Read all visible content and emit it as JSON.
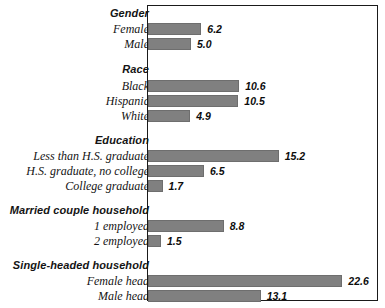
{
  "chart": {
    "type": "bar",
    "orientation": "horizontal",
    "title": "",
    "xlabel": "",
    "ylabel": "",
    "grid": false,
    "legend": null,
    "axis_labels_visible": false,
    "frame": true,
    "bar_color": "#808080",
    "frame_color": "#1a1a1a",
    "value_label_suffix": ""
  },
  "chart_data": {
    "type": "bar",
    "orientation": "horizontal",
    "title": "",
    "xlabel": "",
    "ylabel": "",
    "xlim": [
      0,
      26
    ],
    "grid": false,
    "legend": null,
    "groups": [
      {
        "name": "Gender",
        "categories": [
          "Female",
          "Male"
        ],
        "values": [
          6.2,
          5.0
        ]
      },
      {
        "name": "Race",
        "categories": [
          "Black",
          "Hispanic",
          "White"
        ],
        "values": [
          10.6,
          10.5,
          4.9
        ]
      },
      {
        "name": "Education",
        "categories": [
          "Less than H.S. graduate",
          "H.S. graduate, no college",
          "College graduate"
        ],
        "values": [
          15.2,
          6.5,
          1.7
        ]
      },
      {
        "name": "Married couple household",
        "categories": [
          "1 employed",
          "2 employed"
        ],
        "values": [
          8.8,
          1.5
        ]
      },
      {
        "name": "Single-headed household",
        "categories": [
          "Female head",
          "Male head"
        ],
        "values": [
          22.6,
          13.1
        ]
      }
    ],
    "categories": [
      "Female",
      "Male",
      "Black",
      "Hispanic",
      "White",
      "Less than H.S. graduate",
      "H.S. graduate, no college",
      "College graduate",
      "1 employed",
      "2 employed",
      "Female head",
      "Male head"
    ],
    "values": [
      6.2,
      5.0,
      10.6,
      10.5,
      4.9,
      15.2,
      6.5,
      1.7,
      8.8,
      1.5,
      22.6,
      13.1
    ]
  },
  "rows": [
    {
      "kind": "group",
      "label": "Gender",
      "value": null,
      "value_text": "",
      "top": 6
    },
    {
      "kind": "item",
      "label": "Female",
      "value": 6.2,
      "value_text": "6.2",
      "top": 22
    },
    {
      "kind": "item",
      "label": "Male",
      "value": 5.0,
      "value_text": "5.0",
      "top": 37
    },
    {
      "kind": "group",
      "label": "Race",
      "value": null,
      "value_text": "",
      "top": 62
    },
    {
      "kind": "item",
      "label": "Black",
      "value": 10.6,
      "value_text": "10.6",
      "top": 79
    },
    {
      "kind": "item",
      "label": "Hispanic",
      "value": 10.5,
      "value_text": "10.5",
      "top": 94
    },
    {
      "kind": "item",
      "label": "White",
      "value": 4.9,
      "value_text": "4.9",
      "top": 109
    },
    {
      "kind": "group",
      "label": "Education",
      "value": null,
      "value_text": "",
      "top": 133
    },
    {
      "kind": "item",
      "label": "Less than H.S. graduate",
      "value": 15.2,
      "value_text": "15.2",
      "top": 149
    },
    {
      "kind": "item",
      "label": "H.S. graduate, no college",
      "value": 6.5,
      "value_text": "6.5",
      "top": 164
    },
    {
      "kind": "item",
      "label": "College graduate",
      "value": 1.7,
      "value_text": "1.7",
      "top": 179
    },
    {
      "kind": "group",
      "label": "Married couple household",
      "value": null,
      "value_text": "",
      "top": 203
    },
    {
      "kind": "item",
      "label": "1 employed",
      "value": 8.8,
      "value_text": "8.8",
      "top": 219
    },
    {
      "kind": "item",
      "label": "2 employed",
      "value": 1.5,
      "value_text": "1.5",
      "top": 234
    },
    {
      "kind": "group",
      "label": "Single-headed household",
      "value": null,
      "value_text": "",
      "top": 258
    },
    {
      "kind": "item",
      "label": "Female head",
      "value": 22.6,
      "value_text": "22.6",
      "top": 274
    },
    {
      "kind": "item",
      "label": "Male head",
      "value": 13.1,
      "value_text": "13.1",
      "top": 289
    }
  ]
}
